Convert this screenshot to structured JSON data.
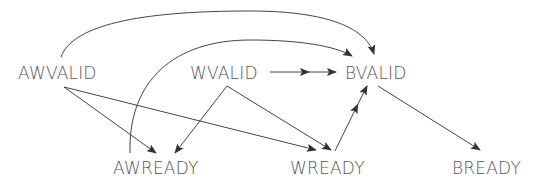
{
  "diagram": {
    "nodes": [
      {
        "id": "AWVALID",
        "label": "AWVALID"
      },
      {
        "id": "WVALID",
        "label": "WVALID"
      },
      {
        "id": "BVALID",
        "label": "BVALID"
      },
      {
        "id": "AWREADY",
        "label": "AWREADY"
      },
      {
        "id": "WREADY",
        "label": "WREADY"
      },
      {
        "id": "BREADY",
        "label": "BREADY"
      }
    ],
    "edges": [
      {
        "from": "AWVALID",
        "to": "BVALID",
        "style": "single-arrow",
        "shape": "arc"
      },
      {
        "from": "AWREADY",
        "to": "BVALID",
        "style": "single-arrow",
        "shape": "arc"
      },
      {
        "from": "WVALID",
        "to": "BVALID",
        "style": "double-arrow",
        "shape": "straight"
      },
      {
        "from": "AWVALID",
        "to": "AWREADY",
        "style": "single-arrow",
        "shape": "straight"
      },
      {
        "from": "AWVALID",
        "to": "WREADY",
        "style": "single-arrow",
        "shape": "straight"
      },
      {
        "from": "WVALID",
        "to": "AWREADY",
        "style": "single-arrow",
        "shape": "straight"
      },
      {
        "from": "WVALID",
        "to": "WREADY",
        "style": "single-arrow",
        "shape": "straight"
      },
      {
        "from": "WREADY",
        "to": "BVALID",
        "style": "double-arrow",
        "shape": "straight"
      },
      {
        "from": "BVALID",
        "to": "BREADY",
        "style": "single-arrow",
        "shape": "straight"
      }
    ],
    "colors": {
      "line": "#444444",
      "text": "#555555",
      "background": "#ffffff"
    }
  }
}
